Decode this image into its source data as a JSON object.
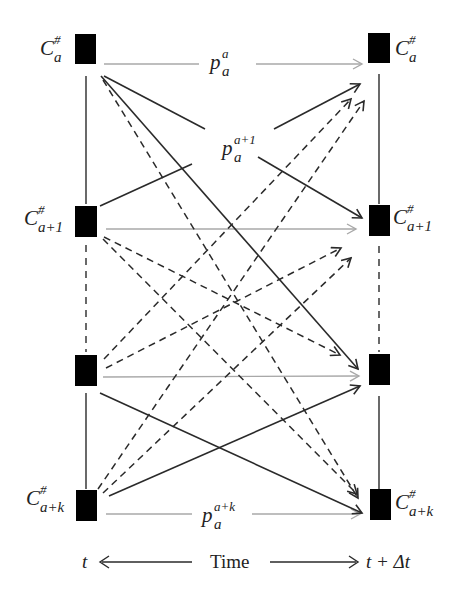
{
  "diagram": {
    "left_nodes": [
      {
        "label": "C",
        "sup": "#",
        "sub": "a"
      },
      {
        "label": "C",
        "sup": "#",
        "sub": "a+1"
      },
      {
        "label": "",
        "sup": "",
        "sub": ""
      },
      {
        "label": "C",
        "sup": "#",
        "sub": "a+k"
      }
    ],
    "right_nodes": [
      {
        "label": "C",
        "sup": "#",
        "sub": "a"
      },
      {
        "label": "C",
        "sup": "#",
        "sub": "a+1"
      },
      {
        "label": "",
        "sup": "",
        "sub": ""
      },
      {
        "label": "C",
        "sup": "#",
        "sub": "a+k"
      }
    ],
    "edge_labels": [
      {
        "base": "p",
        "sup": "a",
        "sub": "a"
      },
      {
        "base": "p",
        "sup": "a+1",
        "sub": "a"
      },
      {
        "base": "p",
        "sup": "a+k",
        "sub": "a"
      }
    ],
    "axis": {
      "left": "t",
      "center": "Time",
      "right": "t + Δt"
    },
    "colors": {
      "node": "#000000",
      "solid_edge": "#2a2a2a",
      "dashed_edge": "#2a2a2a",
      "persist_edge": "#a8a8a8"
    }
  }
}
